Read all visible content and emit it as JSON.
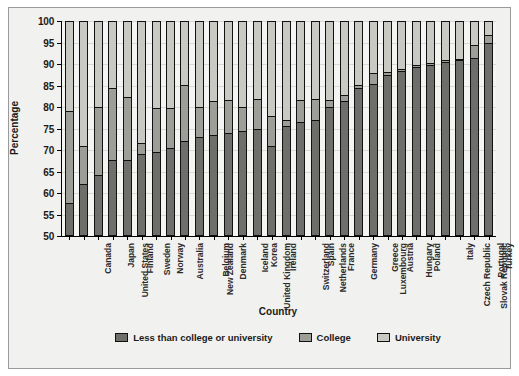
{
  "chart_data": {
    "type": "bar",
    "title": "",
    "subtitle": "",
    "xlabel": "Country",
    "ylabel": "Percentage",
    "ylim": [
      50,
      100
    ],
    "yticks": [
      50,
      55,
      60,
      65,
      70,
      75,
      80,
      85,
      90,
      95,
      100
    ],
    "grid": true,
    "stacked": true,
    "legend_position": "bottom",
    "categories": [
      "Canada",
      "United States",
      "Japan",
      "Finland",
      "Sweden",
      "Norway",
      "Australia",
      "New Zealand",
      "Belgium",
      "Denmark",
      "United Kingdom",
      "Iceland",
      "Korea",
      "Ireland",
      "Switzerland",
      "Netherlands",
      "Spain",
      "France",
      "Germany",
      "Luxembourg",
      "Greece",
      "Austria",
      "Hungary",
      "Poland",
      "Czech Republic",
      "Slovak Republic",
      "Italy",
      "Portugal",
      "Turkey",
      "Mexico"
    ],
    "series": [
      {
        "name": "Less than college or university",
        "color": "#6e6e6b",
        "values": [
          57.5,
          62.0,
          64.0,
          67.5,
          67.5,
          69.0,
          69.5,
          70.5,
          72.0,
          73.0,
          73.5,
          74.0,
          74.5,
          75.0,
          71.0,
          75.5,
          76.5,
          77.0,
          80.0,
          81.5,
          84.5,
          85.5,
          87.5,
          88.5,
          89.5,
          90.0,
          90.5,
          91.0,
          91.5,
          95.0
        ]
      },
      {
        "name": "College",
        "color": "#9e9e99",
        "values": [
          21.5,
          9.0,
          16.0,
          17.0,
          14.8,
          2.7,
          10.4,
          9.4,
          13.2,
          7.1,
          7.9,
          7.7,
          5.5,
          6.9,
          7.0,
          1.5,
          5.3,
          4.9,
          1.8,
          1.3,
          0.8,
          2.6,
          0.8,
          0.4,
          0.5,
          0.4,
          0.5,
          0.4,
          3.0,
          2.0
        ]
      },
      {
        "name": "University",
        "color": "#c9c9c4",
        "values": [
          21.0,
          29.0,
          20.0,
          15.5,
          17.7,
          28.3,
          20.1,
          20.1,
          14.8,
          19.9,
          18.6,
          18.3,
          20.0,
          18.1,
          22.0,
          23.0,
          18.2,
          18.1,
          18.2,
          17.2,
          14.7,
          11.9,
          11.7,
          11.1,
          10.0,
          9.6,
          9.0,
          8.6,
          5.5,
          3.0
        ]
      }
    ],
    "series_tops": {
      "less_than_college": [
        57.5,
        62.0,
        64.0,
        67.5,
        67.5,
        69.0,
        69.5,
        70.5,
        72.0,
        73.0,
        73.5,
        74.0,
        74.5,
        75.0,
        71.0,
        75.5,
        76.5,
        77.0,
        80.0,
        81.5,
        84.5,
        85.5,
        87.5,
        88.5,
        89.5,
        90.0,
        90.5,
        91.0,
        91.5,
        95.0
      ],
      "college": [
        79.0,
        71.0,
        80.0,
        84.5,
        82.3,
        71.7,
        79.9,
        79.9,
        85.2,
        80.1,
        81.4,
        81.7,
        80.0,
        81.9,
        78.0,
        77.0,
        81.8,
        81.9,
        81.8,
        82.8,
        85.3,
        88.1,
        88.3,
        88.9,
        90.0,
        90.4,
        91.0,
        91.4,
        94.5,
        97.0
      ],
      "university": [
        100,
        100,
        100,
        100,
        100,
        100,
        100,
        100,
        100,
        100,
        100,
        100,
        100,
        100,
        100,
        100,
        100,
        100,
        100,
        100,
        100,
        100,
        100,
        100,
        100,
        100,
        100,
        100,
        100,
        100
      ]
    }
  },
  "legend": {
    "items": [
      {
        "label": "Less than college or university",
        "color": "#6e6e6b"
      },
      {
        "label": "College",
        "color": "#9e9e99"
      },
      {
        "label": "University",
        "color": "#c9c9c4"
      }
    ]
  },
  "axes": {
    "y_title": "Percentage",
    "x_title": "Country"
  }
}
